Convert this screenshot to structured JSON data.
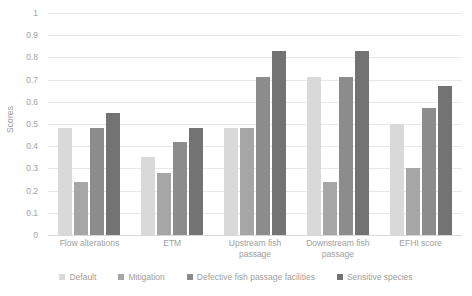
{
  "chart_data": {
    "type": "bar",
    "title": "",
    "xlabel": "",
    "ylabel": "Scores",
    "ylim": [
      0,
      1
    ],
    "grid": true,
    "legend_position": "bottom",
    "categories": [
      "Flow alterations",
      "ETM",
      "Upstream fish passage",
      "Downstream fish passage",
      "EFHI score"
    ],
    "yticks": [
      "0",
      "0.1",
      "0.2",
      "0.3",
      "0.4",
      "0.5",
      "0.6",
      "0.7",
      "0.8",
      "0.9",
      "1"
    ],
    "series": [
      {
        "name": "Default",
        "color": "#d9d9d9",
        "values": [
          0.48,
          0.35,
          0.48,
          0.71,
          0.5
        ]
      },
      {
        "name": "Mitigation",
        "color": "#a6a6a6",
        "values": [
          0.24,
          0.28,
          0.48,
          0.24,
          0.3
        ]
      },
      {
        "name": "Defective fish passage facilities",
        "color": "#8c8c8c",
        "values": [
          0.48,
          0.42,
          0.71,
          0.71,
          0.57
        ]
      },
      {
        "name": "Sensitive species",
        "color": "#737373",
        "values": [
          0.55,
          0.48,
          0.83,
          0.83,
          0.67
        ]
      }
    ]
  }
}
